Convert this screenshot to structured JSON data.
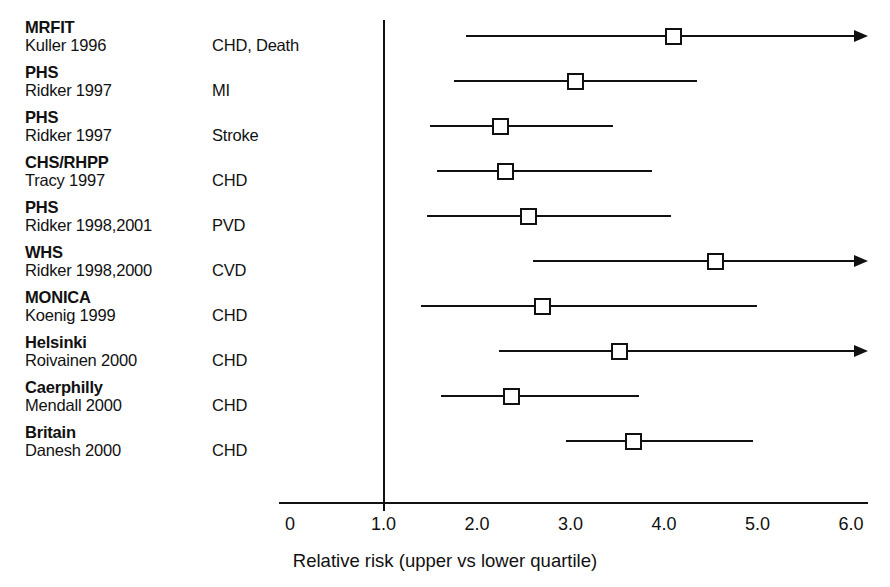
{
  "chart_data": {
    "type": "scatter",
    "subtype": "forest-plot",
    "title": "",
    "xlabel": "Relative risk (upper vs lower quartile)",
    "ylabel": "",
    "xlim": [
      0,
      6.2
    ],
    "reference_line": 1.0,
    "grid": false,
    "legend": null,
    "axis": {
      "ticks": [
        0,
        1.0,
        2.0,
        3.0,
        4.0,
        5.0,
        6.0
      ],
      "tick_labels": [
        "0",
        "1.0",
        "2.0",
        "3.0",
        "4.0",
        "5.0",
        "6.0"
      ],
      "tick_marked": [
        false,
        true,
        false,
        false,
        false,
        false,
        false
      ]
    },
    "columns": [
      "Study",
      "Author Year",
      "Outcome",
      "Relative risk",
      "95% CI lower",
      "95% CI upper"
    ],
    "rows": [
      {
        "study": "MRFIT",
        "author": "Kuller 1996",
        "outcome": "CHD, Death",
        "rr": 4.1,
        "ci_low": 1.88,
        "ci_high": 6.2,
        "ci_high_open": true
      },
      {
        "study": "PHS",
        "author": "Ridker 1997",
        "outcome": "MI",
        "rr": 3.05,
        "ci_low": 1.75,
        "ci_high": 4.35,
        "ci_high_open": false
      },
      {
        "study": "PHS",
        "author": "Ridker 1997",
        "outcome": "Stroke",
        "rr": 2.25,
        "ci_low": 1.5,
        "ci_high": 3.45,
        "ci_high_open": false
      },
      {
        "study": "CHS/RHPP",
        "author": "Tracy 1997",
        "outcome": "CHD",
        "rr": 2.3,
        "ci_low": 1.57,
        "ci_high": 3.87,
        "ci_high_open": false
      },
      {
        "study": "PHS",
        "author": "Ridker 1998,2001",
        "outcome": "PVD",
        "rr": 2.55,
        "ci_low": 1.47,
        "ci_high": 4.08,
        "ci_high_open": false
      },
      {
        "study": "WHS",
        "author": "Ridker 1998,2000",
        "outcome": "CVD",
        "rr": 4.55,
        "ci_low": 2.6,
        "ci_high": 6.2,
        "ci_high_open": true
      },
      {
        "study": "MONICA",
        "author": "Koenig 1999",
        "outcome": "CHD",
        "rr": 2.7,
        "ci_low": 1.4,
        "ci_high": 5.0,
        "ci_high_open": false
      },
      {
        "study": "Helsinki",
        "author": "Roivainen 2000",
        "outcome": "CHD",
        "rr": 3.52,
        "ci_low": 2.23,
        "ci_high": 6.2,
        "ci_high_open": true
      },
      {
        "study": "Caerphilly",
        "author": "Mendall 2000",
        "outcome": "CHD",
        "rr": 2.37,
        "ci_low": 1.62,
        "ci_high": 3.73,
        "ci_high_open": false
      },
      {
        "study": "Britain",
        "author": "Danesh 2000",
        "outcome": "CHD",
        "rr": 3.67,
        "ci_low": 2.95,
        "ci_high": 4.95,
        "ci_high_open": false
      }
    ]
  },
  "layout": {
    "x0_px": 290,
    "px_per_unit": 93.5,
    "axis_left_px": 279,
    "axis_right_px": 868,
    "axis_y_px": 502,
    "row_top_px": 18,
    "row_step_px": 45,
    "ref_line_top_px": 20,
    "ref_line_bottom_px": 502
  },
  "colors": {
    "ink": "#111111",
    "background": "#ffffff"
  }
}
